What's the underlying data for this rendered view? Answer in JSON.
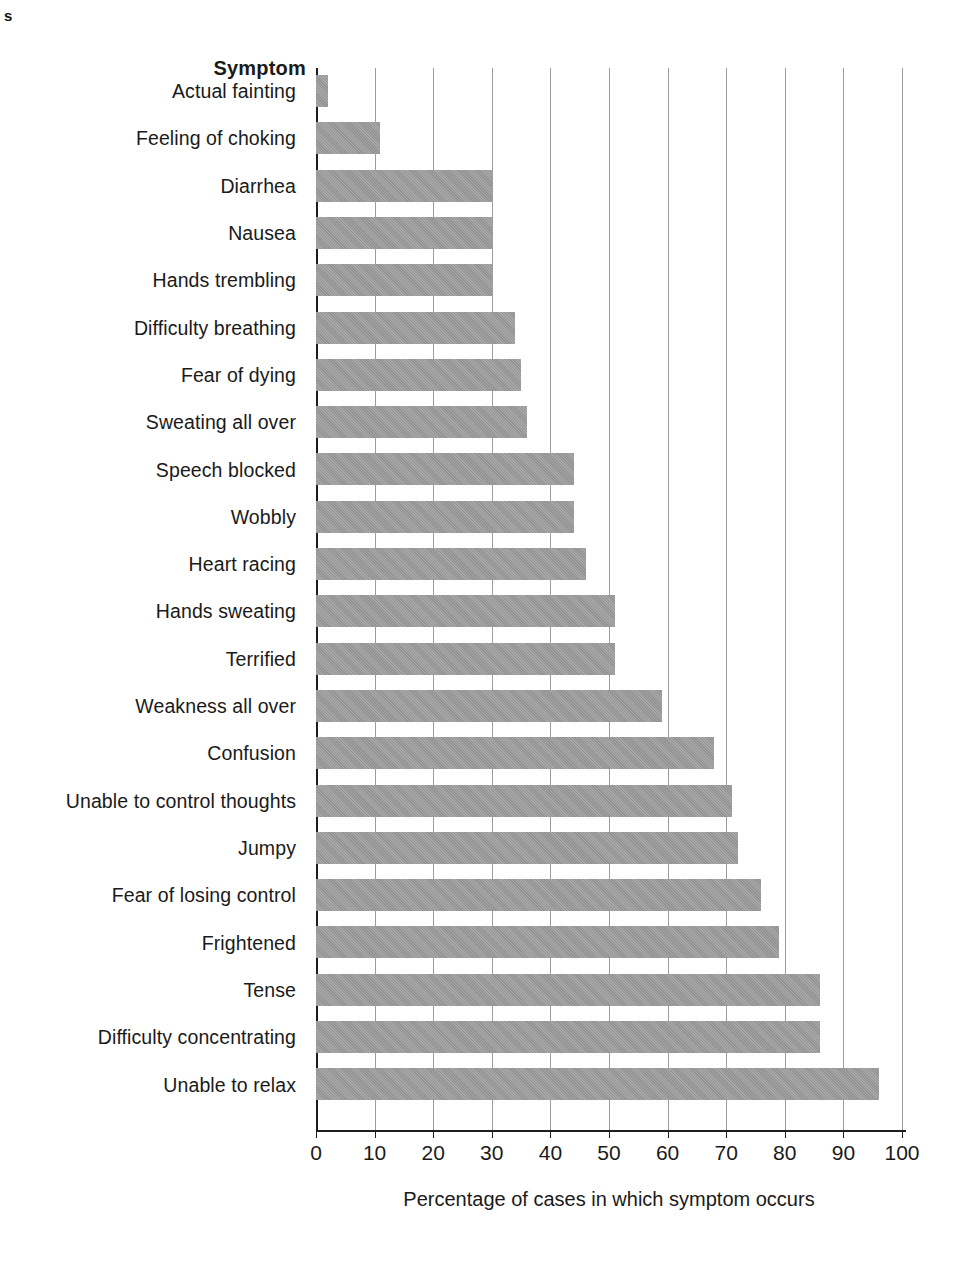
{
  "artifact": {
    "stray_glyph": "s"
  },
  "axis_name_label": "Symptom",
  "x_axis_title": "Percentage of cases in which symptom occurs",
  "chart_data": {
    "type": "bar",
    "orientation": "horizontal",
    "title": "",
    "subtitle": "",
    "xlabel": "Percentage of cases in which symptom occurs",
    "ylabel": "Symptom",
    "xlim": [
      0,
      100
    ],
    "xticks": [
      0,
      10,
      20,
      30,
      40,
      50,
      60,
      70,
      80,
      90,
      100
    ],
    "xtick_labels": [
      "0",
      "10",
      "20",
      "30",
      "40",
      "50",
      "60",
      "70",
      "80",
      "90",
      "100"
    ],
    "grid": "vertical",
    "legend": null,
    "bar_color": "#9a9a9a",
    "categories": [
      "Actual fainting",
      "Feeling of choking",
      "Diarrhea",
      "Nausea",
      "Hands trembling",
      "Difficulty breathing",
      "Fear of dying",
      "Sweating all over",
      "Speech blocked",
      "Wobbly",
      "Heart racing",
      "Hands sweating",
      "Terrified",
      "Weakness all over",
      "Confusion",
      "Unable to control thoughts",
      "Jumpy",
      "Fear of losing control",
      "Frightened",
      "Tense",
      "Difficulty concentrating",
      "Unable to relax"
    ],
    "values": [
      2,
      11,
      30,
      30,
      30,
      34,
      35,
      36,
      44,
      44,
      46,
      51,
      51,
      59,
      68,
      71,
      72,
      76,
      79,
      86,
      86,
      96
    ]
  }
}
